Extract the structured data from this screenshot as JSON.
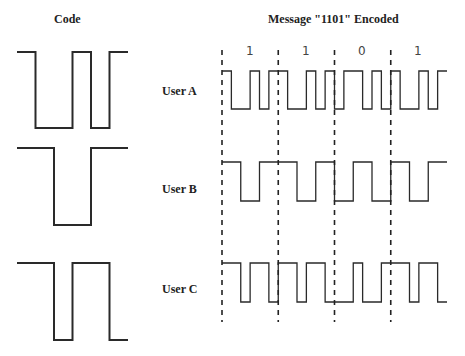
{
  "titles": {
    "code": "Code",
    "message": "Message \"1101\" Encoded"
  },
  "message_bits": [
    "1",
    "1",
    "0",
    "1"
  ],
  "users": [
    {
      "label": "User A",
      "code_chips": [
        1,
        0,
        0,
        1,
        0,
        1
      ]
    },
    {
      "label": "User B",
      "code_chips": [
        1,
        1,
        0,
        0,
        1,
        1
      ]
    },
    {
      "label": "User C",
      "code_chips": [
        1,
        1,
        0,
        1,
        1,
        0
      ]
    }
  ],
  "colors": {
    "line": "#2a2a2a",
    "text": "#222222"
  }
}
